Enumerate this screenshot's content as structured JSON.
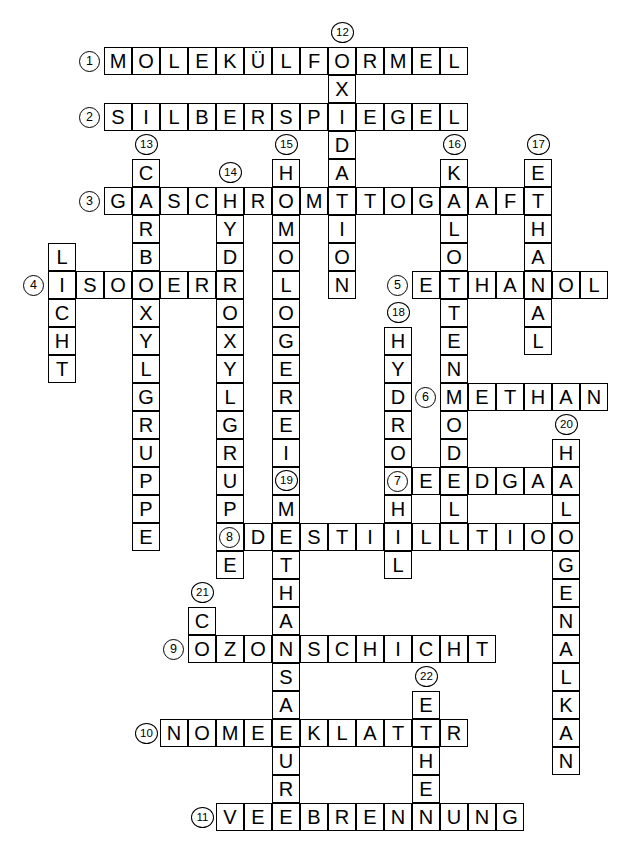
{
  "puzzle": {
    "title": "Chemie Kreuzwortraetsel",
    "cell_size": 28,
    "origin_x": 104,
    "origin_y": 47,
    "grid_cols": 18,
    "grid_rows": 28,
    "across": [
      {
        "number": "1",
        "answer": "MOLEKÜLFORMEL",
        "row": 0,
        "col": 0
      },
      {
        "number": "2",
        "answer": "SILBERSPIEGEL",
        "row": 2,
        "col": 0
      },
      {
        "number": "3",
        "answer": "GASCHROMATOGRAF",
        "row": 5,
        "col": 0
      },
      {
        "number": "4",
        "answer": "ISOMER",
        "row": 8,
        "col": -2
      },
      {
        "number": "5",
        "answer": "ETHANOL",
        "row": 8,
        "col": 11
      },
      {
        "number": "6",
        "answer": "METHAN",
        "row": 12,
        "col": 12
      },
      {
        "number": "7",
        "answer": "ERDGAS",
        "row": 15,
        "col": 11
      },
      {
        "number": "8",
        "answer": "DESTILLATION",
        "row": 17,
        "col": 5
      },
      {
        "number": "9",
        "answer": "OZONSCHICHT",
        "row": 21,
        "col": 3
      },
      {
        "number": "10",
        "answer": "NOMENKLATUR",
        "row": 24,
        "col": 2
      },
      {
        "number": "11",
        "answer": "VERBRENNUNG",
        "row": 27,
        "col": 4
      }
    ],
    "down": [
      {
        "number": "12",
        "answer": "OXIDATION",
        "row": 0,
        "col": 8
      },
      {
        "number": "13",
        "answer": "CARBOXYLGRUPPE",
        "row": 4,
        "col": 1
      },
      {
        "number": "14",
        "answer": "HYDROXYLGRUPPE",
        "row": 5,
        "col": 4
      },
      {
        "number": "15",
        "answer": "HOMOLOGEREIHE",
        "row": 4,
        "col": 6
      },
      {
        "number": "16",
        "answer": "KALOTTENMODELL",
        "row": 4,
        "col": 12
      },
      {
        "number": "17",
        "answer": "ETHANAL",
        "row": 4,
        "col": 15
      },
      {
        "number": "18",
        "answer": "HYDROPHIL",
        "row": 10,
        "col": 10
      },
      {
        "number": "19",
        "answer": "METHANSAEURE",
        "row": 16,
        "col": 6
      },
      {
        "number": "20",
        "answer": "HALOGENALKAN",
        "row": 14,
        "col": 16
      },
      {
        "number": "21",
        "answer": "CO",
        "row": 20,
        "col": 3
      },
      {
        "number": "22",
        "answer": "ETHEN",
        "row": 23,
        "col": 11
      }
    ],
    "extra_down": [
      {
        "answer": "LICHT",
        "row": 7,
        "col": -2
      }
    ]
  }
}
